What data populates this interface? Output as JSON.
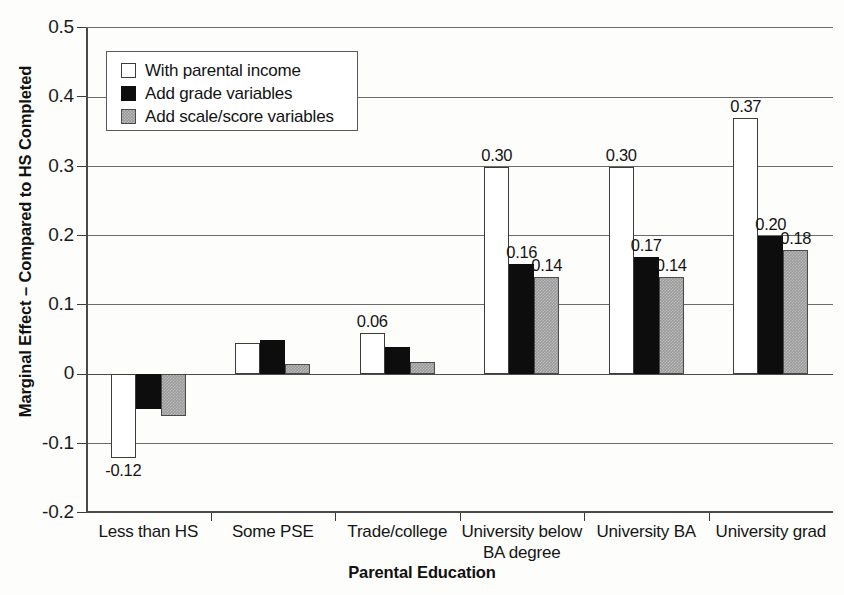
{
  "chart_data": {
    "type": "bar",
    "title": "",
    "xlabel": "Parental Education",
    "ylabel": "Marginal Effect – Compared to HS Completed",
    "ylim": [
      -0.2,
      0.5
    ],
    "ytick_step": 0.1,
    "ytick_labels": [
      "0.5",
      "0.4",
      "0.3",
      "0.2",
      "0.1",
      "0",
      "-0.1",
      "-0.2"
    ],
    "ytick_values": [
      0.5,
      0.4,
      0.3,
      0.2,
      0.1,
      0,
      -0.1,
      -0.2
    ],
    "grid": true,
    "legend_position": "top-left",
    "categories": [
      "Less than HS",
      "Some PSE",
      "Trade/college",
      "University below\nBA degree",
      "University BA",
      "University grad"
    ],
    "series": [
      {
        "name": "With parental income",
        "values": [
          -0.12,
          0.045,
          0.06,
          0.3,
          0.3,
          0.37
        ],
        "labels": [
          "-0.12",
          "",
          "0.06",
          "0.30",
          "0.30",
          "0.37"
        ]
      },
      {
        "name": "Add grade variables",
        "values": [
          -0.05,
          0.05,
          0.04,
          0.16,
          0.17,
          0.2
        ],
        "labels": [
          "",
          "",
          "",
          "0.16",
          "0.17",
          "0.20"
        ]
      },
      {
        "name": "Add scale/score variables",
        "values": [
          -0.06,
          0.015,
          0.018,
          0.14,
          0.14,
          0.18
        ],
        "labels": [
          "",
          "",
          "",
          "0.14",
          "0.14",
          "0.18"
        ]
      }
    ]
  },
  "legend": {
    "items": [
      {
        "label": "With parental income"
      },
      {
        "label": "Add grade variables"
      },
      {
        "label": "Add scale/score variables"
      }
    ]
  },
  "axes": {
    "x_title": "Parental Education",
    "y_title": "Marginal Effect – Compared to HS Completed"
  }
}
